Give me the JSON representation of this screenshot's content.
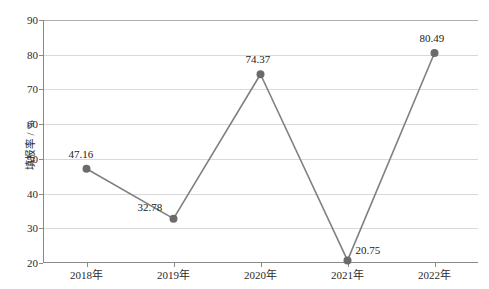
{
  "chart_data": {
    "type": "line",
    "title": "",
    "xlabel": "",
    "ylabel": "填报率 / %",
    "categories": [
      "2018年",
      "2019年",
      "2020年",
      "2021年",
      "2022年"
    ],
    "values": [
      47.16,
      32.78,
      74.37,
      20.75,
      80.49
    ],
    "point_labels": [
      "47.16",
      "32.78",
      "74.37",
      "20.75",
      "80.49"
    ],
    "ylim": [
      20,
      90
    ],
    "yticks": [
      20,
      30,
      40,
      50,
      60,
      70,
      80,
      90
    ],
    "ytick_labels": [
      "20",
      "30",
      "40",
      "50",
      "60",
      "70",
      "80",
      "90"
    ],
    "grid": true,
    "grid_axis": "y",
    "legend": false,
    "legend_position": "none",
    "series": [
      {
        "name": "填报率",
        "values": [
          47.16,
          32.78,
          74.37,
          20.75,
          80.49
        ]
      }
    ],
    "colors": {
      "line": "#808080",
      "marker": "#6b6b6b",
      "grid": "#d9d9d9",
      "axis": "#8a8a8a",
      "text": "#1a1a1a"
    }
  }
}
